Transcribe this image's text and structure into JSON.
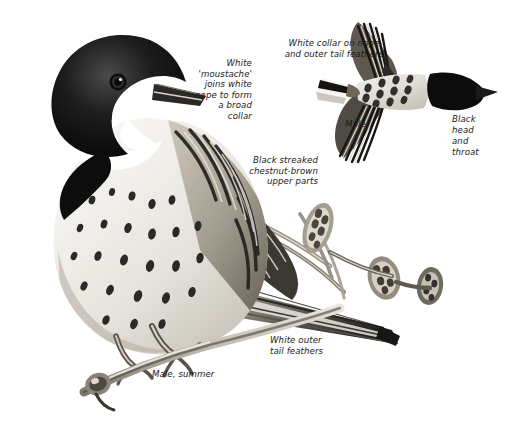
{
  "plate": {
    "subject": "Reed Bunting",
    "background_color": "#ffffff",
    "ink_color": "#1b1b1b",
    "medium": "monochrome pen-and-ink / wash field-guide illustration"
  },
  "labels": {
    "moustache": "White\n'moustache'\njoins white\nnape to form\na broad\ncollar",
    "upperparts": "Black streaked\nchestnut-brown\nupper parts",
    "collar_nape": "White collar on nape\nand outer tail feathers",
    "male_flight": "Male",
    "black_head": "Black\nhead\nand\nthroat",
    "outer_tail": "White outer\ntail feathers",
    "male_summer": "Male, summer"
  },
  "figures": {
    "perched": {
      "name": "perched-male-summer-bird",
      "caption": "Male, summer",
      "description": "Bunting perched on reed stems, head black, white moustache and collar, streaked breast and chestnut-brown streaked upper parts, long tail angled down-right"
    },
    "flight": {
      "name": "male-in-flight-bird",
      "caption": "Male",
      "description": "Male in flight seen from above, wings spread, black head to the right, white collar on nape, white outer tail feathers to the left"
    },
    "vegetation": {
      "name": "reed-stems-and-seedheads",
      "description": "Reed stems with seed heads crossing behind and below the perched bird"
    }
  }
}
